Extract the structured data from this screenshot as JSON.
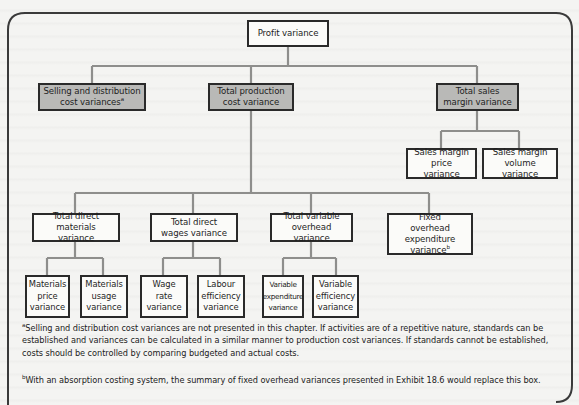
{
  "diagram": {
    "root": {
      "label": "Profit variance"
    },
    "level1": [
      {
        "id": "selling",
        "label": "Selling and distribution cost variances",
        "footnote_mark": "a",
        "shaded": true
      },
      {
        "id": "production",
        "label": "Total production cost variance",
        "shaded": true
      },
      {
        "id": "sales",
        "label": "Total sales margin variance",
        "shaded": true
      }
    ],
    "sales_children": [
      {
        "label": "Sales margin price variance"
      },
      {
        "label": "Sales margin volume variance"
      }
    ],
    "production_children": [
      {
        "label": "Total direct materials variance"
      },
      {
        "label": "Total direct wages variance"
      },
      {
        "label": "Total variable overhead variance"
      },
      {
        "label": "Fixed overhead expenditure variance",
        "footnote_mark": "b"
      }
    ],
    "materials_children": [
      {
        "label": "Materials price variance"
      },
      {
        "label": "Materials usage variance"
      }
    ],
    "wages_children": [
      {
        "label": "Wage rate variance"
      },
      {
        "label": "Labour efficiency variance"
      }
    ],
    "overhead_children": [
      {
        "label": "Variable expenditure variance"
      },
      {
        "label": "Variable efficiency variance"
      }
    ]
  },
  "footnotes": [
    {
      "mark": "a",
      "text": "Selling and distribution cost variances are not presented in this chapter. If activities are of a repetitive nature, standards can be established and variances can be calculated in a similar manner to production cost variances. If standards cannot be established, costs should be controlled by comparing budgeted and actual costs."
    },
    {
      "mark": "b",
      "text": "With an absorption costing system, the summary of fixed overhead variances presented in Exhibit 18.6 would replace this box."
    }
  ],
  "colors": {
    "box_border": "#2a2a2a",
    "shaded_box": "#b9b9b7",
    "connector": "#8e8e8c",
    "frame": "#3a3a3a"
  }
}
